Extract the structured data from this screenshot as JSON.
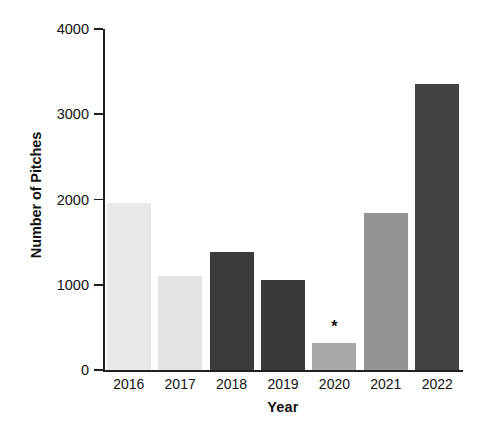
{
  "chart_data": {
    "type": "bar",
    "title": "",
    "xlabel": "Year",
    "ylabel": "Number of Pitches",
    "categories": [
      "2016",
      "2017",
      "2018",
      "2019",
      "2020",
      "2021",
      "2022"
    ],
    "values": [
      1955,
      1105,
      1380,
      1060,
      315,
      1840,
      3355
    ],
    "bar_colors": [
      "#e9e9e9",
      "#e4e4e4",
      "#3b3b3b",
      "#3a3a3a",
      "#a9a9a9",
      "#949494",
      "#424242"
    ],
    "annotations": [
      {
        "category": "2020",
        "text": "*"
      }
    ],
    "ylim": [
      0,
      4000
    ],
    "yticks": [
      0,
      1000,
      2000,
      3000,
      4000
    ],
    "ytick_labels": [
      "0",
      "1000",
      "2000",
      "3000",
      "4000"
    ],
    "grid": false,
    "legend": "none",
    "axis_color": "#231f20",
    "background": "#ffffff"
  }
}
